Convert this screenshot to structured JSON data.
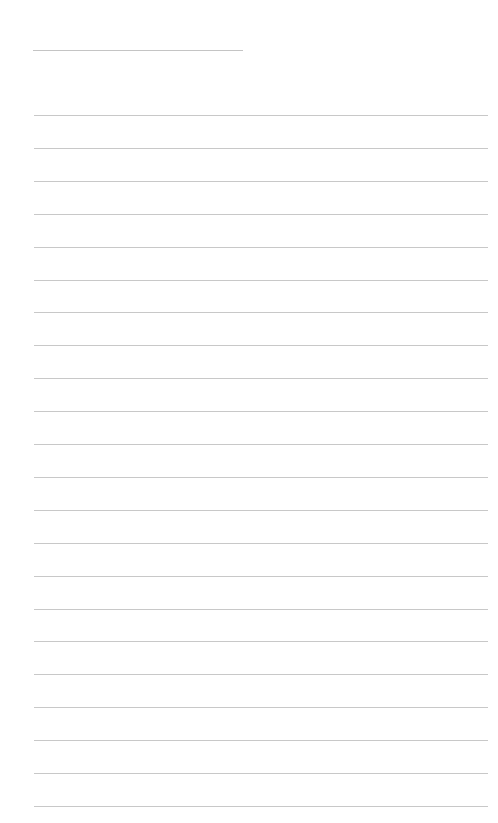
{
  "page": {
    "type": "lined-paper",
    "background_color": "#ffffff",
    "line_color": "#c8c8c8",
    "title_line": {
      "x": 33,
      "y": 50,
      "width": 210,
      "text": ""
    },
    "rules": {
      "count": 22,
      "x": 34,
      "width": 454,
      "first_y": 115,
      "spacing": 32.9,
      "lines": [
        "",
        "",
        "",
        "",
        "",
        "",
        "",
        "",
        "",
        "",
        "",
        "",
        "",
        "",
        "",
        "",
        "",
        "",
        "",
        "",
        "",
        ""
      ]
    }
  }
}
